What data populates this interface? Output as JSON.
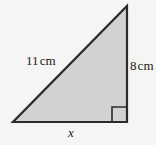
{
  "figure": {
    "type": "right-triangle-diagram",
    "background_color": "#f6f5f3",
    "fill_color": "#d2d2d2",
    "stroke_color": "#2b2b2b",
    "text_color": "#1a1a1a",
    "labels": {
      "hypotenuse": {
        "value": "11",
        "unit": "cm",
        "full": "11 cm"
      },
      "vertical_side": {
        "value": "8",
        "unit": "cm",
        "full": "8 cm"
      },
      "base": {
        "value": "x",
        "unit": "",
        "full": "x"
      }
    },
    "vertices": {
      "apex": "127,6",
      "bottom_right": "127,122",
      "bottom_left": "13,122"
    },
    "right_angle_marker": {
      "name": "right-angle-square",
      "corner": "bottom-right"
    }
  }
}
